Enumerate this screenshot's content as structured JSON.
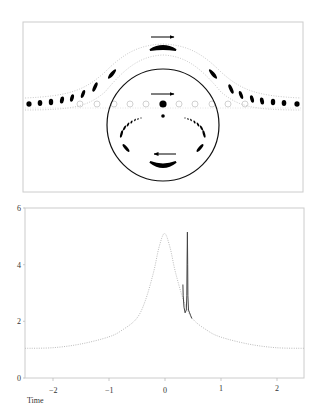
{
  "diagram": {
    "frame": {
      "x": 23,
      "y": 22,
      "w": 280,
      "h": 170,
      "stroke": "#cccccc"
    },
    "circle": {
      "cx": 163,
      "cy": 125,
      "r": 56,
      "stroke": "#111111"
    },
    "arrows": [
      {
        "name": "top-arrow-right",
        "x1": 151,
        "x2": 174,
        "y": 37,
        "dir": "right"
      },
      {
        "name": "center-arrow-right",
        "x1": 151,
        "x2": 174,
        "y": 94,
        "dir": "right"
      },
      {
        "name": "bottom-arrow-left",
        "x1": 154,
        "x2": 176,
        "y": 154,
        "dir": "left"
      }
    ],
    "colors": {
      "ink": "#000000",
      "faint": "#cccccc",
      "band": "#bbbbbb"
    }
  },
  "chart_data": {
    "type": "line",
    "title": "",
    "xlabel": "Time",
    "ylabel": "",
    "xlim": [
      -2.5,
      2.5
    ],
    "ylim": [
      0,
      6
    ],
    "xticks": [
      -2,
      -1,
      0,
      1,
      2
    ],
    "xtick_labels": [
      "−2",
      "−1",
      "0",
      "1",
      "2"
    ],
    "yticks": [
      0,
      2,
      4,
      6
    ],
    "ytick_labels": [
      "0",
      "2",
      "4",
      "6"
    ],
    "grid": false,
    "legend": null,
    "series": [
      {
        "name": "dotted-curve",
        "style": "dotted",
        "color": "#bbbbbb",
        "x": [
          -2.5,
          -2.0,
          -1.5,
          -1.0,
          -0.75,
          -0.5,
          -0.35,
          -0.2,
          -0.1,
          0.0,
          0.1,
          0.2,
          0.35,
          0.5,
          0.75,
          1.0,
          1.5,
          2.0,
          2.5
        ],
        "y": [
          1.05,
          1.07,
          1.2,
          1.45,
          1.7,
          2.1,
          2.7,
          3.7,
          4.6,
          5.1,
          4.6,
          3.7,
          2.7,
          2.1,
          1.7,
          1.45,
          1.2,
          1.07,
          1.05
        ]
      },
      {
        "name": "solid-spike",
        "style": "solid",
        "color": "#444444",
        "x": [
          0.33,
          0.335,
          0.35,
          0.37,
          0.39,
          0.4,
          0.405,
          0.41,
          0.415,
          0.42,
          0.43,
          0.45,
          0.47,
          0.49
        ],
        "y": [
          3.3,
          2.9,
          2.5,
          2.3,
          2.4,
          2.9,
          4.2,
          5.15,
          4.0,
          2.9,
          2.4,
          2.3,
          2.2,
          2.1
        ]
      }
    ]
  }
}
